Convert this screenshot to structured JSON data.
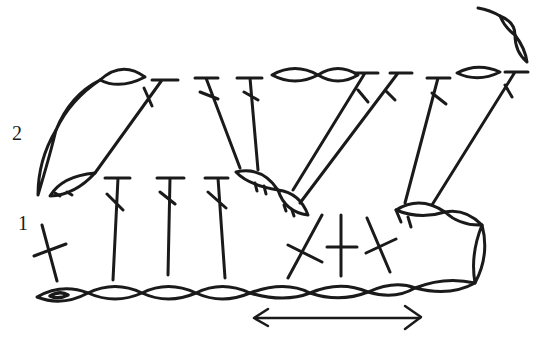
{
  "diagram": {
    "type": "crochet-stitch-chart",
    "row_labels": {
      "row1": "1",
      "row2": "2"
    },
    "stroke_color": "#1a1a1a",
    "background": "#ffffff",
    "foundation_chain_count": 8,
    "row1": {
      "stitches": [
        "sc",
        "dc",
        "dc",
        "dc",
        "sc",
        "sc",
        "sc"
      ]
    },
    "row2": {
      "stitches": [
        "ch",
        "ch",
        "ch",
        "ch",
        "dc",
        "dc",
        "dc",
        "ch",
        "ch",
        "dc",
        "dc",
        "dc",
        "ch",
        "dc"
      ]
    },
    "direction_arrow": "left-right"
  }
}
